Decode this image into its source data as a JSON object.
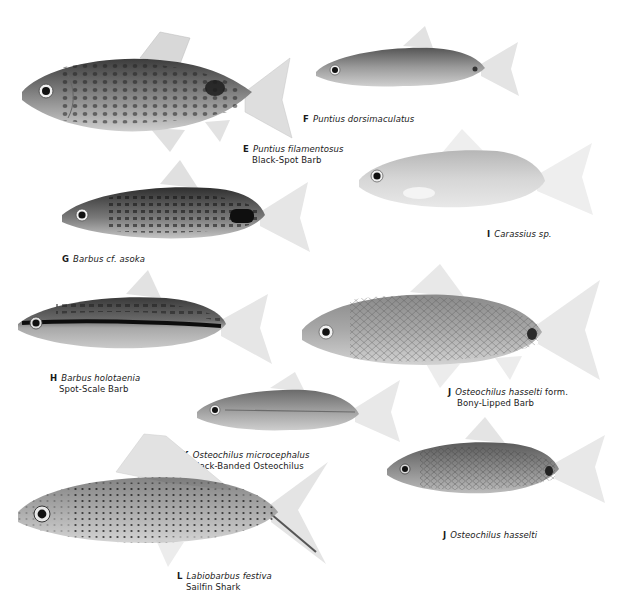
{
  "plate": {
    "fishes": [
      {
        "letter": "E",
        "scientific": "Puntius filamentosus",
        "common": "Black-Spot Barb"
      },
      {
        "letter": "F",
        "scientific": "Puntius dorsimaculatus",
        "common": ""
      },
      {
        "letter": "G",
        "scientific": "Barbus cf. asoka",
        "common": ""
      },
      {
        "letter": "I",
        "scientific": "Carassius sp.",
        "common": ""
      },
      {
        "letter": "H",
        "scientific": "Barbus holotaenia",
        "common": "Spot-Scale Barb"
      },
      {
        "letter": "J",
        "scientific": "Osteochilus hasselti",
        "scientific_suffix": " form.",
        "common": "Bony-Lipped Barb"
      },
      {
        "letter": "K",
        "scientific": "Osteochilus microcephalus",
        "common": "Black-Banded Osteochilus"
      },
      {
        "letter": "J",
        "scientific": "Osteochilus hasselti",
        "common": ""
      },
      {
        "letter": "L",
        "scientific": "Labiobarbus festiva",
        "common": "Sailfin Shark"
      }
    ]
  },
  "colors": {
    "background": "#ffffff",
    "text": "#1a1a1a",
    "fish_dark": "#3a3a3a",
    "fish_mid": "#8a8a8a",
    "fish_light": "#d4d4d4",
    "fin": "#e4e4e4"
  }
}
